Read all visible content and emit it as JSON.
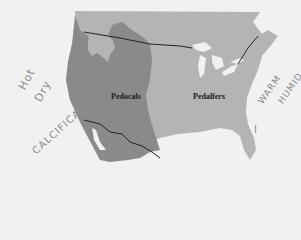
{
  "map": {
    "regions": [
      {
        "name": "Pedocals",
        "color": "#8a8a8a"
      },
      {
        "name": "Pedalfers",
        "color": "#b4b4b4"
      }
    ],
    "labels": {
      "pedocals": "Pedocals",
      "pedalfers": "Pedalfers"
    },
    "annotations": {
      "west_line1": "Hot",
      "west_line2": "Dry",
      "west_line3": "CALCIFICATION",
      "east_line1": "WARM",
      "east_line2": "HUMID",
      "east_mark": "I"
    },
    "colors": {
      "background": "#f1f1f1",
      "pedocals": "#8a8a8a",
      "pedalfers": "#b4b4b4",
      "lakes": "#f1f1f1",
      "border_line": "#222222",
      "handwriting": "#8a8a8a"
    }
  }
}
